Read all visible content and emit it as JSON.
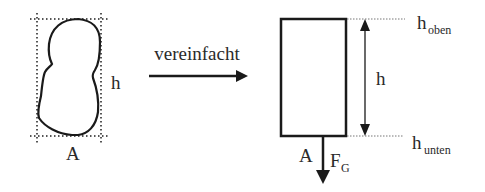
{
  "diagram": {
    "left_figure": {
      "height_label": "h",
      "area_label": "A"
    },
    "transform_arrow": {
      "label": "vereinfacht"
    },
    "right_figure": {
      "height_label": "h",
      "area_label": "A",
      "force_label": "F",
      "force_subscript": "G",
      "top_label": "h",
      "top_subscript": "oben",
      "bottom_label": "h",
      "bottom_subscript": "unten"
    },
    "colors": {
      "stroke": "#1a1a1a",
      "dotted": "#555555",
      "background": "#ffffff"
    }
  }
}
